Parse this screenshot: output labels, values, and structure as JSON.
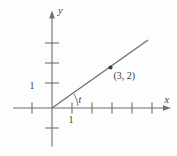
{
  "figure": {
    "x_axis": {
      "label": "x",
      "tick_label": "1",
      "ticks_right_of_origin": 5,
      "ticks_left_of_origin": 1
    },
    "y_axis": {
      "label": "y",
      "tick_label": "1",
      "ticks_above_origin": 3,
      "ticks_below_origin": 1
    },
    "line": {
      "passes_through": "origin",
      "point": {
        "x": 3,
        "y": 2
      },
      "point_label": "(3, 2)"
    },
    "angle": {
      "label": "t",
      "vertex": "origin",
      "between": "x-axis and line"
    }
  },
  "colors": {
    "axis": "#6f6f6f",
    "line": "#6f6f6f",
    "text": "#3d3d3d",
    "background": "#fdfdfd"
  }
}
